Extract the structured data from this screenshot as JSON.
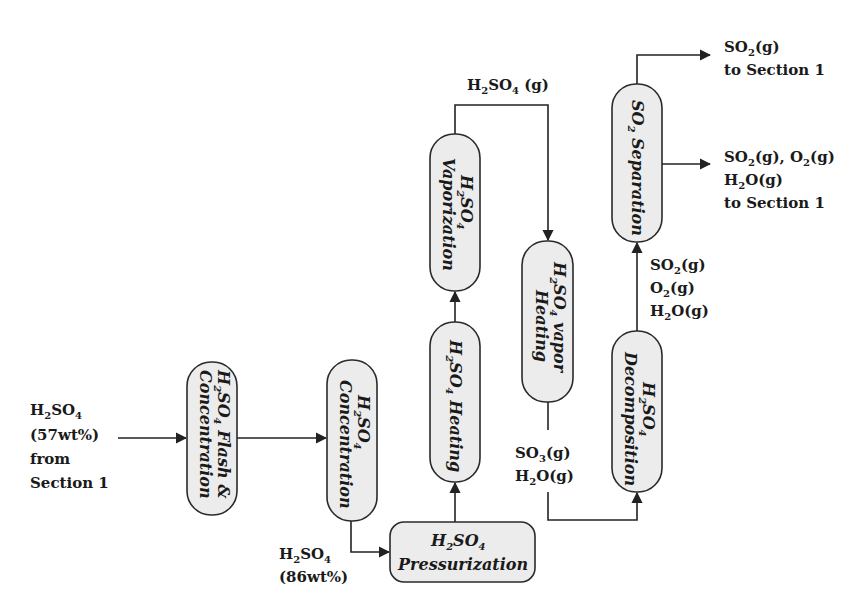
{
  "diagram": {
    "type": "process-flow",
    "units": [
      {
        "id": "flash",
        "formula": "H2SO4",
        "label_line1_suffix": " Flash &",
        "label_line2": "Concentration"
      },
      {
        "id": "concentration",
        "formula": "H2SO4",
        "label_line2": "Concentration"
      },
      {
        "id": "pressurization",
        "formula": "H2SO4",
        "label_line2": "Pressurization"
      },
      {
        "id": "heating",
        "formula": "H2SO4",
        "label_suffix": " Heating"
      },
      {
        "id": "vaporization",
        "formula": "H2SO4",
        "label_line2": "Vaporization"
      },
      {
        "id": "vapor_heating",
        "formula": "H2SO4",
        "label_line1_suffix": " vapor",
        "label_line2": "Heating"
      },
      {
        "id": "decomposition",
        "formula": "H2SO4",
        "label_line2": "Decomposition"
      },
      {
        "id": "so2_separation",
        "formula": "SO2",
        "label_suffix": " Separation"
      }
    ],
    "streams": {
      "feed": {
        "line1": "H2SO4",
        "line2": "(57wt%)",
        "line3": "from",
        "line4": "Section 1"
      },
      "concentrated": {
        "line1": "H2SO4",
        "line2": "(86wt%)"
      },
      "vapor": {
        "line1": "H2SO4 (g)"
      },
      "so3_h2o": {
        "line1": "SO3(g)",
        "line2": "H2O(g)"
      },
      "decomp_products": {
        "line1": "SO2(g)",
        "line2": "O2(g)",
        "line3": "H2O(g)"
      },
      "so2_out": {
        "line1": "SO2(g)",
        "line2": "to Section 1"
      },
      "mixed_out": {
        "line1": "SO2(g), O2(g)",
        "line2": "H2O(g)",
        "line3": "to Section 1"
      }
    },
    "text": {
      "H": "H",
      "S": "SO",
      "sub2": "2",
      "sub3": "3",
      "sub4": "4",
      "O": "O",
      "g": "(g)",
      "gsp": " (g)",
      "comma": ", ",
      "flash_suffix": " Flash &",
      "concentration": "Concentration",
      "pressurization": "Pressurization",
      "heating_suffix": " Heating",
      "vaporization": "Vaporization",
      "vapor_suffix": " vapor",
      "heating": "Heating",
      "decomposition": "Decomposition",
      "separation_suffix": " Separation",
      "wt57": "(57wt%)",
      "wt86": "(86wt%)",
      "from": "from",
      "section1": "Section 1",
      "to_section1": "to Section 1"
    },
    "colors": {
      "box_fill": "#ececec",
      "stroke": "#2a2a2a",
      "text": "#1a1a1a"
    }
  }
}
